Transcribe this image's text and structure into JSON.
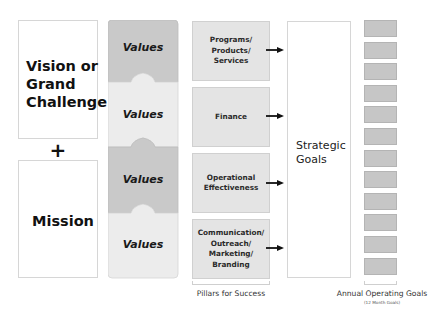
{
  "diagram": {
    "left": {
      "vision_label": "Vision or\nGrand\nChallenge",
      "plus_symbol": "+",
      "mission_label": "Mission"
    },
    "values": {
      "items": [
        {
          "label": "Values",
          "color": "#c9c9c9"
        },
        {
          "label": "Values",
          "color": "#ececec"
        },
        {
          "label": "Values",
          "color": "#c9c9c9"
        },
        {
          "label": "Values",
          "color": "#ececec"
        }
      ]
    },
    "pillars": {
      "items": [
        {
          "label": "Programs/\nProducts/\nServices"
        },
        {
          "label": "Finance"
        },
        {
          "label": "Operational\nEffectiveness"
        },
        {
          "label": "Communication/\nOutreach/\nMarketing/\nBranding"
        }
      ],
      "caption": "Pillars for Success"
    },
    "strategic_goals": {
      "label": "Strategic\nGoals"
    },
    "annual_goals": {
      "count": 12,
      "caption": "Annual Operating Goals",
      "subcaption": "(12 Month Goals)",
      "box_color": "#c6c6c6"
    }
  }
}
